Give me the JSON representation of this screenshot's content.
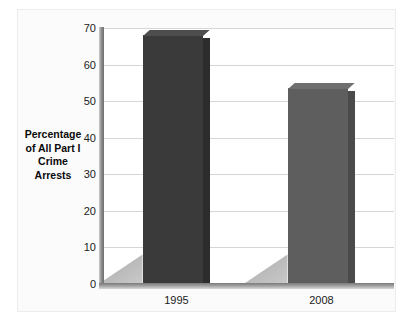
{
  "chart_data": {
    "type": "bar",
    "title": "",
    "subtitle": "",
    "xlabel": "",
    "ylabel": "Percentage of All Part I Crime Arrests",
    "ylabel_lines": [
      "Percentage",
      "of All Part I",
      "Crime",
      "Arrests"
    ],
    "categories": [
      "1995",
      "2008"
    ],
    "values": [
      68,
      53.5
    ],
    "series": [
      {
        "name": "Percentage of All Part I Crime Arrests",
        "values": [
          68,
          53.5
        ]
      }
    ],
    "ylim": [
      0,
      70
    ],
    "yticks": [
      0,
      10,
      20,
      30,
      40,
      50,
      60,
      70
    ],
    "ytick_labels": [
      "0",
      "10",
      "20",
      "30",
      "40",
      "50",
      "60",
      "70"
    ],
    "xtick_labels": [
      "1995",
      "2008"
    ],
    "grid": "horizontal",
    "legend": "none",
    "annotations": [],
    "bar_colors": [
      "#3a3a3a",
      "#5e5e5e"
    ],
    "bar_top_colors": [
      "#4d4d4d",
      "#6f6f6f"
    ],
    "bar_side_colors": [
      "#2c2c2c",
      "#4a4a4a"
    ],
    "style": "3d-extruded-bars-with-shadow",
    "colors": {
      "background": "#ffffff",
      "plot_background": "#ffffff",
      "gridline": "#d6d6d6",
      "axis": "#8f8f8f",
      "text": "#1a1a1a",
      "frame": "#ececec"
    }
  }
}
